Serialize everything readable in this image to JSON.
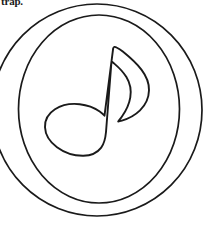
{
  "page": {
    "width": 204,
    "height": 233,
    "background_color": "#ffffff",
    "ink_color": "#1a1a1a",
    "kind": "line-art coloring page"
  },
  "caption": {
    "fragment_text": "trap.",
    "note": "partially cropped text line at top-left edge of the page"
  },
  "artwork": {
    "title": "eighth note inside concentric circles",
    "subject_icon": "music-note-icon",
    "fill": "none",
    "stroke_color": "#1a1a1a",
    "outer_circle": {
      "name": "outer-circle",
      "cx": 97,
      "cy": 110,
      "rx": 105,
      "ry": 106,
      "stroke_width": 1.6
    },
    "inner_circle": {
      "name": "inner-circle",
      "cx": 99,
      "cy": 109,
      "rx": 80,
      "ry": 94,
      "stroke_width": 1.6
    },
    "note": {
      "name": "eighth-note",
      "stroke_width": 1.8,
      "head": {
        "name": "note-head",
        "cx": 74,
        "cy": 128,
        "rx": 31,
        "ry": 25,
        "rotation_deg": -8
      },
      "stem": {
        "name": "note-stem",
        "apex_x": 117,
        "apex_y": 47,
        "base_x": 101,
        "base_y": 148
      },
      "flag": {
        "name": "note-flag",
        "tip_x": 145,
        "tip_y": 78,
        "curl_x": 127,
        "curl_y": 122
      }
    }
  }
}
